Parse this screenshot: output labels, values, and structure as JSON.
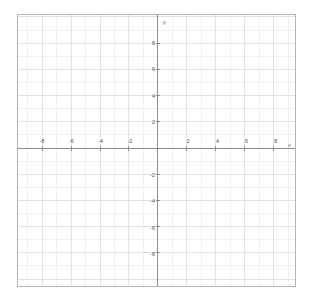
{
  "chart_data": {
    "type": "scatter",
    "title": "",
    "subtitle": "",
    "xlabel": "x",
    "ylabel": "y",
    "xlim": [
      -9.6,
      9.4
    ],
    "ylim": [
      -10.1,
      10.1
    ],
    "grid": true,
    "legend": null,
    "series": [],
    "x": [],
    "y": [],
    "annotations": [],
    "x_major_ticks": [
      -8,
      -6,
      -4,
      -2,
      2,
      4,
      6,
      8
    ],
    "y_major_ticks": [
      8,
      6,
      4,
      2,
      -2,
      -4,
      -6,
      -8
    ],
    "x_tick_labels": [
      "-8",
      "-6",
      "-4",
      "-2",
      "2",
      "4",
      "6",
      "8"
    ],
    "y_tick_labels": [
      "8",
      "6",
      "4",
      "2",
      "-2",
      "-4",
      "-6",
      "-8"
    ],
    "minor_tick_step": 1,
    "major_tick_step": 2,
    "origin_label": ""
  },
  "plot": {
    "x_axis_label": "x",
    "y_axis_label": "y",
    "x_ticks": [
      {
        "value": -8,
        "label": "-8"
      },
      {
        "value": -6,
        "label": "-6"
      },
      {
        "value": -4,
        "label": "-4"
      },
      {
        "value": -2,
        "label": "-2"
      },
      {
        "value": 2,
        "label": "2"
      },
      {
        "value": 4,
        "label": "4"
      },
      {
        "value": 6,
        "label": "6"
      },
      {
        "value": 8,
        "label": "8"
      }
    ],
    "y_ticks": [
      {
        "value": 8,
        "label": "8"
      },
      {
        "value": 6,
        "label": "6"
      },
      {
        "value": 4,
        "label": "4"
      },
      {
        "value": 2,
        "label": "2"
      },
      {
        "value": -2,
        "label": "-2"
      },
      {
        "value": -4,
        "label": "-4"
      },
      {
        "value": -6,
        "label": "-6"
      },
      {
        "value": -8,
        "label": "-8"
      }
    ]
  },
  "colors": {
    "background": "#ffffff",
    "border": "#b6b6b6",
    "minor_grid": "#f0f0f0",
    "major_grid": "#e2e2e2",
    "axis": "#8c8c8c",
    "tick_text": "#4a4a4a",
    "axis_name_text": "#6a6a6a"
  }
}
